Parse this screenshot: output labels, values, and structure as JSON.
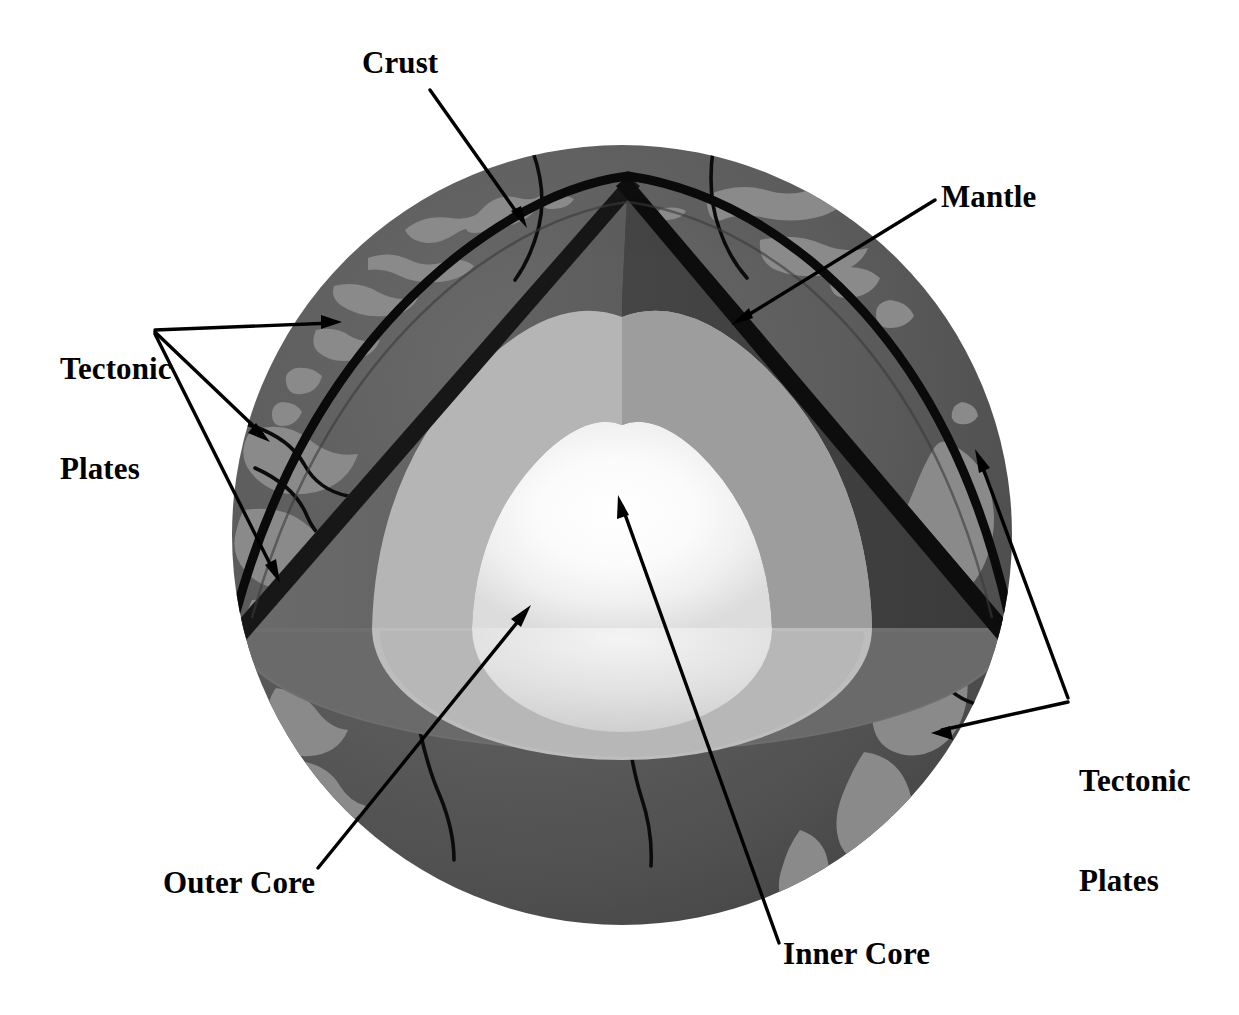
{
  "diagram": {
    "type": "cross-section-illustration",
    "background_color": "#ffffff"
  },
  "labels": {
    "crust": "Crust",
    "mantle": "Mantle",
    "tectonic_plates_left_line1": "Tectonic",
    "tectonic_plates_left_line2": "Plates",
    "tectonic_plates_right_line1": "Tectonic",
    "tectonic_plates_right_line2": "Plates",
    "outer_core": "Outer Core",
    "inner_core": "Inner Core"
  },
  "layers": [
    {
      "name": "Crust",
      "color": "#111111",
      "description": "thin black outer shell line"
    },
    {
      "name": "Mantle",
      "color": "#4e4e4e",
      "description": "dark grey thick layer beneath crust"
    },
    {
      "name": "Outer Core",
      "color": "#b3b3b3",
      "description": "light grey layer surrounding inner core"
    },
    {
      "name": "Inner Core",
      "color": "#fbfbfb",
      "description": "bright white glowing sphere at centre"
    }
  ],
  "surface": {
    "ocean_color": "#595959",
    "continent_color": "#858585",
    "plate_boundary_color": "#000000",
    "plate_boundary_count": 5
  },
  "colors": {
    "background": "#ffffff",
    "label_text": "#000000",
    "arrow": "#000000",
    "crust_line": "#0d0d0d",
    "mantle_outer_face": "#4e4e4e",
    "mantle_cut_face_left": "#636363",
    "mantle_cut_face_right": "#3d3d3d",
    "outer_core_cut_face_left": "#b8b8b8",
    "outer_core_cut_face_right": "#9a9a9a",
    "inner_core_glow": "#ffffff",
    "inner_core_edge": "#d6d6d6",
    "cut_plane_band_dark": "#6e6e6e",
    "cut_plane_band_light": "#bdbdbd"
  },
  "geometry": {
    "sphere_center_x": 622,
    "sphere_center_y": 535,
    "sphere_radius": 390,
    "wedge_apex_x": 628,
    "wedge_apex_y": 176,
    "cut_plane_y": 628
  },
  "arrows": [
    {
      "name": "crust-arrow",
      "from": [
        430,
        90
      ],
      "to": [
        525,
        225
      ]
    },
    {
      "name": "mantle-arrow",
      "from": [
        935,
        200
      ],
      "to": [
        733,
        323
      ]
    },
    {
      "name": "tectonic-left-arrow-1",
      "from": [
        155,
        330
      ],
      "to": [
        340,
        322
      ]
    },
    {
      "name": "tectonic-left-arrow-2",
      "from": [
        155,
        330
      ],
      "to": [
        268,
        440
      ]
    },
    {
      "name": "tectonic-left-arrow-3",
      "from": [
        155,
        330
      ],
      "to": [
        280,
        580
      ]
    },
    {
      "name": "tectonic-right-arrow-1",
      "from": [
        1068,
        700
      ],
      "to": [
        976,
        452
      ]
    },
    {
      "name": "tectonic-right-arrow-2",
      "from": [
        1068,
        700
      ],
      "to": [
        932,
        733
      ]
    },
    {
      "name": "outer-core-arrow",
      "from": [
        318,
        868
      ],
      "to": [
        530,
        608
      ]
    },
    {
      "name": "inner-core-arrow",
      "from": [
        779,
        943
      ],
      "to": [
        618,
        498
      ]
    }
  ]
}
